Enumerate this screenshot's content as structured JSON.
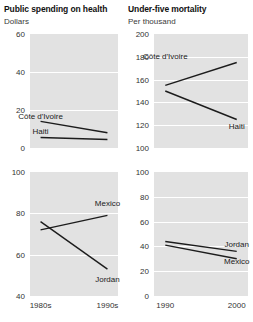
{
  "columns": [
    {
      "title": "Public spending on health",
      "unit": "Dollars"
    },
    {
      "title": "Under-five mortality",
      "unit": "Per thousand"
    }
  ],
  "chart_data": [
    {
      "type": "line",
      "title": "Public spending on health",
      "subtitle": "Africa / Caribbean panel",
      "ylabel": "Dollars",
      "xlabel": "",
      "ylim": [
        0,
        60
      ],
      "yticks": [
        0,
        20,
        40,
        60
      ],
      "ytick_labels": [
        "0",
        "20",
        "40",
        "60"
      ],
      "x": [
        "1980s",
        "1990s"
      ],
      "xtick_labels": [
        "",
        ""
      ],
      "grid": true,
      "legend": "inline-labels",
      "series": [
        {
          "name": "Côte d'Ivoire",
          "values": [
            14,
            8
          ],
          "label_x": "1980s",
          "label_value": 17
        },
        {
          "name": "Haiti",
          "values": [
            5.5,
            4.5
          ],
          "label_x": "1980s",
          "label_value": 9
        }
      ]
    },
    {
      "type": "line",
      "title": "Under-five mortality",
      "subtitle": "Africa / Caribbean panel",
      "ylabel": "Per thousand",
      "xlabel": "",
      "ylim": [
        100,
        200
      ],
      "yticks": [
        100,
        120,
        140,
        160,
        180,
        200
      ],
      "ytick_labels": [
        "100",
        "120",
        "140",
        "160",
        "180",
        "200"
      ],
      "x": [
        "1990",
        "2000"
      ],
      "xtick_labels": [
        "",
        ""
      ],
      "grid": true,
      "legend": "inline-labels",
      "series": [
        {
          "name": "Côte d'Ivoire",
          "values": [
            155,
            175
          ],
          "label_x": "1990",
          "label_value": 181
        },
        {
          "name": "Haiti",
          "values": [
            150,
            125
          ],
          "label_x": "2000",
          "label_value": 119
        }
      ]
    },
    {
      "type": "line",
      "title": "Public spending on health",
      "subtitle": "Middle-income panel",
      "ylabel": "Dollars",
      "xlabel": "",
      "ylim": [
        40,
        100
      ],
      "yticks": [
        40,
        60,
        80,
        100
      ],
      "ytick_labels": [
        "40",
        "60",
        "80",
        "100"
      ],
      "x": [
        "1980s",
        "1990s"
      ],
      "xtick_labels": [
        "1980s",
        "1990s"
      ],
      "grid": true,
      "legend": "inline-labels",
      "series": [
        {
          "name": "Mexico",
          "values": [
            72,
            79
          ],
          "label_x": "1990s",
          "label_value": 85
        },
        {
          "name": "Jordan",
          "values": [
            76,
            53
          ],
          "label_x": "1990s",
          "label_value": 48
        }
      ]
    },
    {
      "type": "line",
      "title": "Under-five mortality",
      "subtitle": "Middle-income panel",
      "ylabel": "Per thousand",
      "xlabel": "",
      "ylim": [
        0,
        100
      ],
      "yticks": [
        0,
        20,
        40,
        60,
        80,
        100
      ],
      "ytick_labels": [
        "0",
        "20",
        "40",
        "60",
        "80",
        "100"
      ],
      "x": [
        "1990",
        "2000"
      ],
      "xtick_labels": [
        "1990",
        "2000"
      ],
      "grid": true,
      "legend": "inline-labels",
      "series": [
        {
          "name": "Jordan",
          "values": [
            44,
            36
          ],
          "label_x": "2000",
          "label_value": 42
        },
        {
          "name": "Mexico",
          "values": [
            41,
            30
          ],
          "label_x": "2000",
          "label_value": 28
        }
      ]
    }
  ]
}
